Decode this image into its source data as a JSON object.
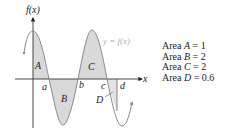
{
  "figure": {
    "y_axis_label": "f(x)",
    "x_axis_label": "x",
    "curve_label": "y = f(x)",
    "points": [
      {
        "id": "a",
        "label": "a"
      },
      {
        "id": "b",
        "label": "b"
      },
      {
        "id": "c",
        "label": "c"
      },
      {
        "id": "d",
        "label": "d"
      }
    ],
    "regions": [
      {
        "id": "A",
        "label": "A"
      },
      {
        "id": "B",
        "label": "B"
      },
      {
        "id": "C",
        "label": "C"
      },
      {
        "id": "D",
        "label": "D"
      }
    ],
    "colors": {
      "shade": "#d9d9d9",
      "curve": "#8a8a8a",
      "axis": "#333333",
      "curve_label": "#b0b0b0"
    }
  },
  "legend": {
    "items": [
      {
        "prefix": "Area ",
        "var": "A",
        "suffix": " = 1"
      },
      {
        "prefix": "Area ",
        "var": "B",
        "suffix": " = 2"
      },
      {
        "prefix": "Area ",
        "var": "C",
        "suffix": " = 2"
      },
      {
        "prefix": "Area ",
        "var": "D",
        "suffix": " = 0.6"
      }
    ]
  }
}
